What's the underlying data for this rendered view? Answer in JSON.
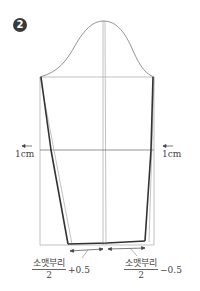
{
  "figure": {
    "step_badge": "2",
    "elbow_left_label": "1cm",
    "elbow_right_label": "1cm",
    "hem_left": {
      "numerator": "소맷부리",
      "denominator": "2",
      "suffix": "+0.5"
    },
    "hem_right": {
      "numerator": "소맷부리",
      "denominator": "2",
      "suffix": "−0.5"
    },
    "colors": {
      "guide_line": "#9a9a9a",
      "pattern_line": "#333333",
      "badge": "#3a3a3a"
    }
  }
}
